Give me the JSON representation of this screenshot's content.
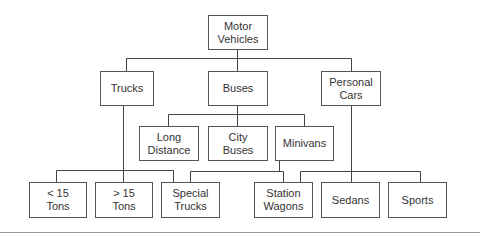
{
  "diagram": {
    "nodes": [
      {
        "id": "motor-vehicles",
        "label": "Motor\nVehicles"
      },
      {
        "id": "trucks",
        "label": "Trucks"
      },
      {
        "id": "buses",
        "label": "Buses"
      },
      {
        "id": "personal-cars",
        "label": "Personal\nCars"
      },
      {
        "id": "long-distance",
        "label": "Long\nDistance"
      },
      {
        "id": "city-buses",
        "label": "City\nBuses"
      },
      {
        "id": "minivans",
        "label": "Minivans"
      },
      {
        "id": "lt-15-tons",
        "label": "< 15\nTons"
      },
      {
        "id": "gt-15-tons",
        "label": "> 15\nTons"
      },
      {
        "id": "special-trucks",
        "label": "Special\nTrucks"
      },
      {
        "id": "station-wagons",
        "label": "Station\nWagons"
      },
      {
        "id": "sedans",
        "label": "Sedans"
      },
      {
        "id": "sports",
        "label": "Sports"
      }
    ],
    "edges": [
      [
        "motor-vehicles",
        "trucks"
      ],
      [
        "motor-vehicles",
        "buses"
      ],
      [
        "motor-vehicles",
        "personal-cars"
      ],
      [
        "buses",
        "long-distance"
      ],
      [
        "buses",
        "city-buses"
      ],
      [
        "buses",
        "minivans"
      ],
      [
        "trucks",
        "lt-15-tons"
      ],
      [
        "trucks",
        "gt-15-tons"
      ],
      [
        "trucks",
        "special-trucks"
      ],
      [
        "minivans",
        "special-trucks"
      ],
      [
        "minivans",
        "station-wagons"
      ],
      [
        "personal-cars",
        "station-wagons"
      ],
      [
        "personal-cars",
        "sedans"
      ],
      [
        "personal-cars",
        "sports"
      ]
    ]
  }
}
